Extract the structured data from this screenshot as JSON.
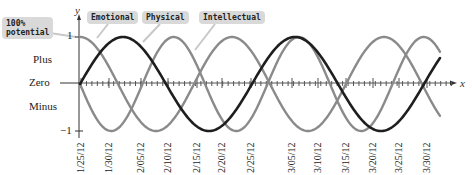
{
  "chart_data": {
    "type": "line",
    "title": "",
    "xlabel": "x",
    "ylabel": "y",
    "ylim": [
      -1,
      1
    ],
    "y_ticks": [
      {
        "value": 1,
        "label": "1"
      },
      {
        "value": 0,
        "label": "Zero"
      },
      {
        "value": -1,
        "label": "−1"
      }
    ],
    "y_region_labels": [
      "Plus",
      "Minus"
    ],
    "x_tick_labels": [
      "1/25/12",
      "1/30/12",
      "2/05/12",
      "2/10/12",
      "2/15/12",
      "2/20/12",
      "2/25/12",
      "3/05/12",
      "3/10/12",
      "3/15/12",
      "3/20/12",
      "3/25/12",
      "3/30/12"
    ],
    "annotations": [
      {
        "text": "100% potential",
        "points_to": "y = 1"
      }
    ],
    "legend": [
      "Emotional",
      "Physical",
      "Intellectual"
    ],
    "series": [
      {
        "name": "Emotional",
        "shape": "cosine",
        "start_value": 1,
        "period_px": 152,
        "color": "#8a8a8a"
      },
      {
        "name": "Physical",
        "shape": "negative-sine",
        "start_value": 0,
        "period_px": 125,
        "color": "#8a8a8a"
      },
      {
        "name": "Intellectual",
        "shape": "sine",
        "start_value": 0,
        "period_px": 172,
        "color": "#1e1e1e"
      }
    ],
    "grid": false
  },
  "labels": {
    "potential_line1": "100%",
    "potential_line2": "potential",
    "emotional": "Emotional",
    "physical": "Physical",
    "intellectual": "Intellectual",
    "y_axis": "y",
    "x_axis": "x",
    "one": "1",
    "plus": "Plus",
    "zero": "Zero",
    "minus": "Minus",
    "minus_one": "−1"
  }
}
